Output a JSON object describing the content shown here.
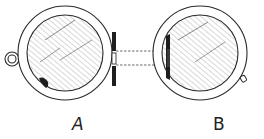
{
  "figure": {
    "type": "technical line drawing",
    "components": [
      {
        "id": "A",
        "label": "A",
        "description": "circular disc with hatched face, side loop/eyelet, hinge plate on right"
      },
      {
        "id": "B",
        "label": "B",
        "description": "circular disc with hatched face, hinge plate on left, small notch at lower right"
      }
    ],
    "connector": {
      "style": "dashed",
      "count": 2
    }
  },
  "colors": {
    "line": "#2a2a2a",
    "hatch": "#6a6a6a",
    "fill_dark": "#1e1e1e",
    "background": "#ffffff"
  }
}
